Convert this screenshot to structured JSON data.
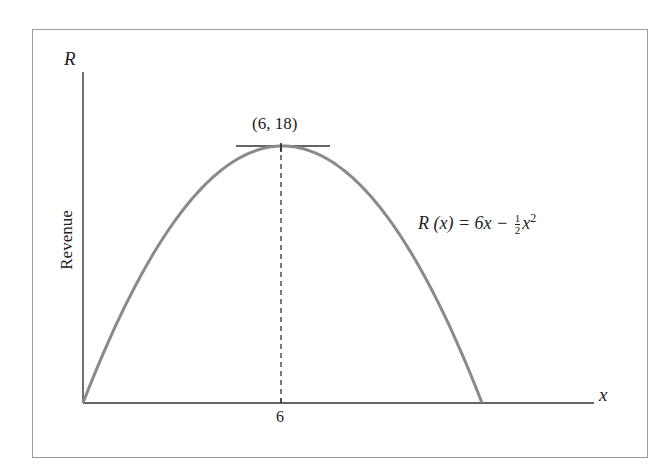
{
  "chart_data": {
    "type": "line",
    "title": "",
    "xlabel": "x",
    "ylabel": "R",
    "ytitle": "Revenue",
    "x_ticks": [
      "6"
    ],
    "xlim": [
      0,
      13.5
    ],
    "ylim": [
      0,
      22
    ],
    "grid": false,
    "series": [
      {
        "name": "R(x) = 6x − ½x²",
        "x": [
          0,
          1,
          2,
          3,
          4,
          5,
          6,
          7,
          8,
          9,
          10,
          11,
          12
        ],
        "values": [
          0,
          5.5,
          10,
          13.5,
          16,
          17.5,
          18,
          17.5,
          16,
          13.5,
          10,
          5.5,
          0
        ]
      }
    ],
    "annotations": [
      {
        "text": "(6, 18)",
        "x": 6,
        "y": 18,
        "note": "vertex with horizontal tangent line"
      },
      {
        "text": "R(x) = 6x − ½x²",
        "note": "curve equation label"
      },
      {
        "note": "dashed vertical line from (6,0) to (6,18)"
      }
    ]
  },
  "labels": {
    "y_axis_var": "R",
    "x_axis_var": "x",
    "y_axis_title": "Revenue",
    "x_tick_6": "6",
    "vertex": "(6, 18)",
    "formula": {
      "lhs": "R (x) = 6x −",
      "frac_num": "1",
      "frac_den": "2",
      "var": "x",
      "exp": "2"
    }
  },
  "colors": {
    "curve": "#8a8a8a",
    "axes": "#333333",
    "frame": "#9a9a9a"
  }
}
